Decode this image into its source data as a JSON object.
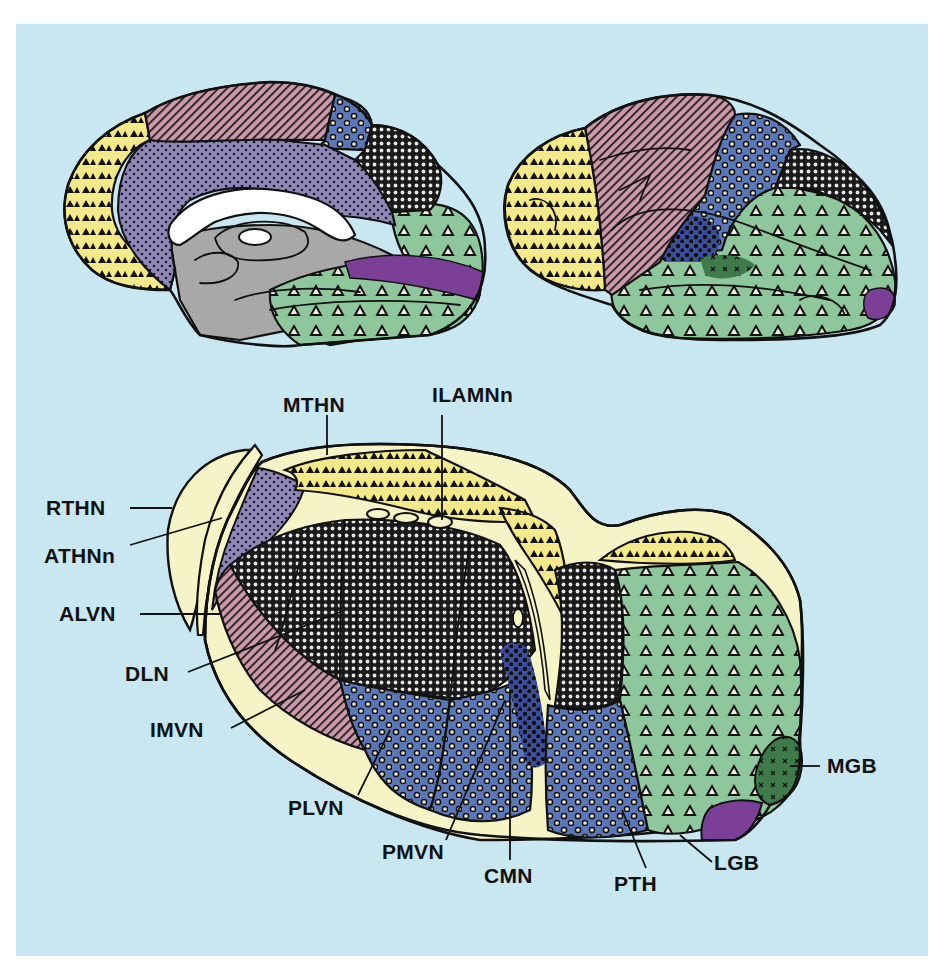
{
  "figure": {
    "background_color": "#c9e7f1",
    "views": [
      {
        "id": "medial-hemisphere",
        "description": "Medial view of cerebral hemisphere"
      },
      {
        "id": "lateral-hemisphere",
        "description": "Lateral view of cerebral hemisphere"
      },
      {
        "id": "thalamus",
        "description": "Three-dimensional view of the thalamus and its nuclei"
      }
    ],
    "labels": {
      "mthn": "MTHN",
      "ilamnn": "ILAMNn",
      "rthn": "RTHN",
      "athnn": "ATHNn",
      "alvn": "ALVN",
      "dln": "DLN",
      "imvn": "IMVN",
      "plvn": "PLVN",
      "pmvn": "PMVN",
      "cmn": "CMN",
      "pth": "PTH",
      "lgb": "LGB",
      "mgb": "MGB"
    },
    "region_colors": {
      "prefrontal_yellow_solid_triangles": "#f3e98a",
      "motor_pink_hatched": "#c99aa8",
      "cingulate_purple_dotted": "#8f87b5",
      "somatosensory_blue_circles": "#5b77b8",
      "parietal_black_crosshatch": "#2a2a2a",
      "temporal_occipital_green_open_triangles": "#8fc79c",
      "auditory_darkgreen_x": "#3f7a4a",
      "visual_violet": "#7b3f98",
      "thalamic_white_matter_cream": "#f6f3c6",
      "brainstem_gray": "#a9a9a9"
    }
  }
}
